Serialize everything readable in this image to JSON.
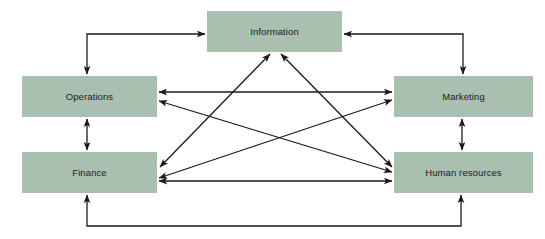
{
  "diagram": {
    "type": "block-flow-diagram",
    "background_color": "#ffffff",
    "node_fill_color": "#a9bfb0",
    "node_text_color": "#1b1b1b",
    "connector_color": "#1a1a1a",
    "nodes": [
      {
        "id": "information",
        "label": "Information",
        "x": 207,
        "y": 11,
        "width": 135,
        "height": 41
      },
      {
        "id": "operations",
        "label": "Operations",
        "x": 22,
        "y": 76,
        "width": 135,
        "height": 41
      },
      {
        "id": "marketing",
        "label": "Marketing",
        "x": 394,
        "y": 76,
        "width": 139,
        "height": 41
      },
      {
        "id": "finance",
        "label": "Finance",
        "x": 22,
        "y": 152,
        "width": 135,
        "height": 41
      },
      {
        "id": "human-resources",
        "label": "Human resources",
        "x": 394,
        "y": 152,
        "width": 139,
        "height": 41
      }
    ],
    "connectors": [
      {
        "id": "operations-information",
        "from": "operations",
        "to": "information",
        "style": "elbow",
        "arrows": "both"
      },
      {
        "id": "marketing-information",
        "from": "marketing",
        "to": "information",
        "style": "elbow",
        "arrows": "both"
      },
      {
        "id": "operations-finance",
        "from": "operations",
        "to": "finance",
        "style": "straight-vertical",
        "arrows": "both"
      },
      {
        "id": "marketing-human-resources",
        "from": "marketing",
        "to": "human-resources",
        "style": "straight-vertical",
        "arrows": "both"
      },
      {
        "id": "operations-marketing",
        "from": "operations",
        "to": "marketing",
        "style": "straight-horizontal",
        "arrows": "both"
      },
      {
        "id": "finance-human-resources",
        "from": "finance",
        "to": "human-resources",
        "style": "straight-horizontal",
        "arrows": "both"
      },
      {
        "id": "finance-information",
        "from": "finance",
        "to": "information",
        "style": "diagonal",
        "arrows": "both"
      },
      {
        "id": "human-resources-information",
        "from": "human-resources",
        "to": "information",
        "style": "diagonal",
        "arrows": "both"
      },
      {
        "id": "operations-human-resources",
        "from": "operations",
        "to": "human-resources",
        "style": "diagonal",
        "arrows": "both"
      },
      {
        "id": "finance-marketing",
        "from": "finance",
        "to": "marketing",
        "style": "diagonal",
        "arrows": "both"
      },
      {
        "id": "finance-human-resources-bottom",
        "from": "finance",
        "to": "human-resources",
        "style": "u-elbow-bottom",
        "arrows": "both"
      }
    ]
  }
}
